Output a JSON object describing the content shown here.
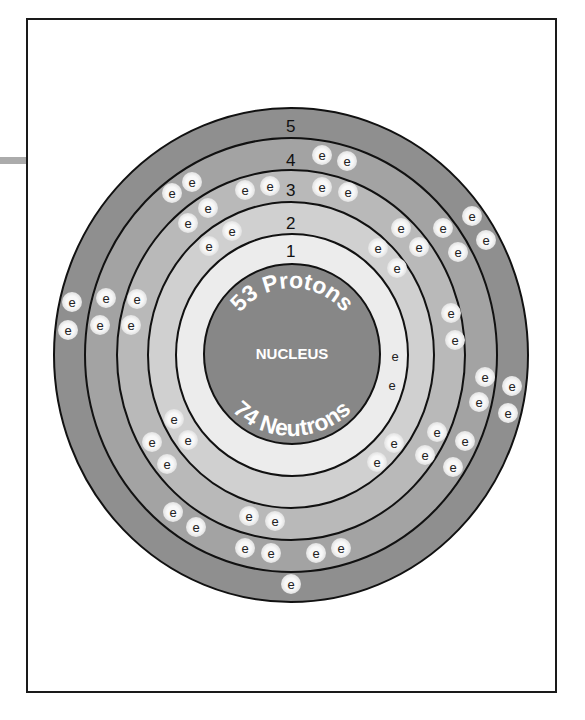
{
  "nucleus": {
    "label": "NUCLEUS",
    "protons_text": "53 Protons",
    "neutrons_text": "74 Neutrons",
    "protons": 53,
    "neutrons": 74,
    "color": "#878787"
  },
  "electron_symbol": "e",
  "shells": [
    {
      "number": "1",
      "electron_count": 2,
      "color": "#ececec"
    },
    {
      "number": "2",
      "electron_count": 8,
      "color": "#d0d0d0"
    },
    {
      "number": "3",
      "electron_count": 18,
      "color": "#b9b9b9"
    },
    {
      "number": "4",
      "electron_count": 18,
      "color": "#a3a3a3"
    },
    {
      "number": "5",
      "electron_count": 7,
      "color": "#8f8f8f"
    }
  ],
  "colors": {
    "ring_line": "#111111",
    "electron_fill": "#f4f4f4",
    "frame": "#1a1a1a",
    "side_bar": "#ababab"
  }
}
